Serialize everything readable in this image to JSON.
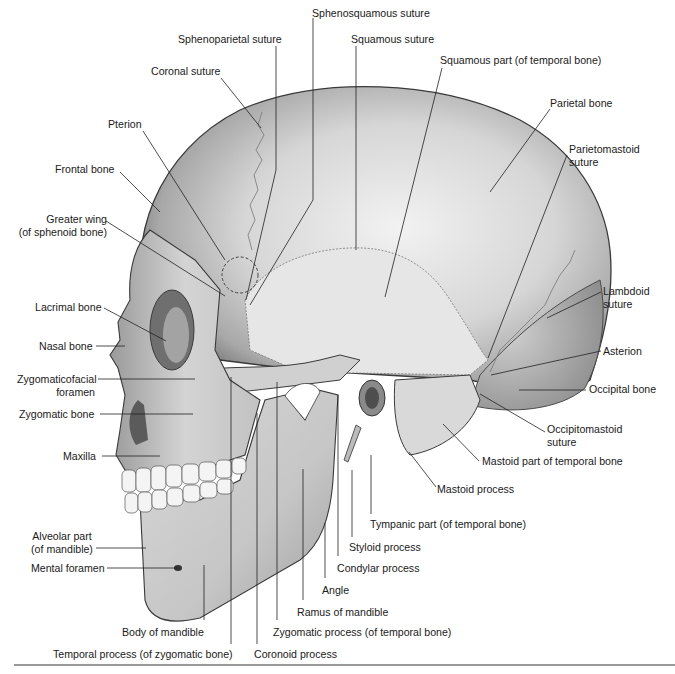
{
  "figure": {
    "colors": {
      "bone_light": "#e9e9e9",
      "bone_mid": "#bdbdbd",
      "bone_dark": "#6e6e6e",
      "outline": "#3a3a3a",
      "leader": "#222222",
      "rule": "#9a9a9a"
    }
  },
  "labels": [
    {
      "id": "sphenosquamous-suture",
      "lines": [
        "Sphenosquamous suture"
      ],
      "x": 312,
      "y": 7,
      "align": "l",
      "leader": [
        [
          313,
          18
        ],
        [
          313,
          200
        ],
        [
          250,
          305
        ]
      ]
    },
    {
      "id": "sphenoparietal-suture",
      "lines": [
        "Sphenoparietal suture"
      ],
      "x": 178,
      "y": 33,
      "align": "l",
      "leader": [
        [
          276,
          46
        ],
        [
          276,
          170
        ],
        [
          246,
          300
        ]
      ]
    },
    {
      "id": "squamous-suture",
      "lines": [
        "Squamous suture"
      ],
      "x": 351,
      "y": 33,
      "align": "l",
      "leader": [
        [
          356,
          46
        ],
        [
          356,
          250
        ]
      ]
    },
    {
      "id": "coronal-suture",
      "lines": [
        "Coronal suture"
      ],
      "x": 151,
      "y": 65,
      "align": "l",
      "leader": [
        [
          221,
          78
        ],
        [
          261,
          128
        ]
      ]
    },
    {
      "id": "squamous-part-temporal",
      "lines": [
        "Squamous part (of temporal bone)"
      ],
      "x": 440,
      "y": 54,
      "align": "l",
      "leader": [
        [
          442,
          68
        ],
        [
          385,
          297
        ]
      ]
    },
    {
      "id": "parietal-bone",
      "lines": [
        "Parietal bone"
      ],
      "x": 550,
      "y": 97,
      "align": "l",
      "leader": [
        [
          550,
          109
        ],
        [
          490,
          192
        ]
      ]
    },
    {
      "id": "pterion",
      "lines": [
        "Pterion"
      ],
      "x": 108,
      "y": 118,
      "align": "l",
      "leader": [
        [
          143,
          131
        ],
        [
          225,
          260
        ]
      ]
    },
    {
      "id": "parietomastoid-suture",
      "lines": [
        "Parietomastoid",
        "suture"
      ],
      "x": 569,
      "y": 143,
      "align": "l",
      "leader": [
        [
          567,
          155
        ],
        [
          488,
          358
        ]
      ]
    },
    {
      "id": "frontal-bone",
      "lines": [
        "Frontal bone"
      ],
      "x": 55,
      "y": 163,
      "align": "l",
      "leader": [
        [
          120,
          172
        ],
        [
          160,
          212
        ]
      ]
    },
    {
      "id": "greater-wing-sphenoid",
      "lines": [
        "Greater wing",
        "(of sphenoid bone)"
      ],
      "x": 14,
      "y": 213,
      "align": "r",
      "w": 93,
      "leader": [
        [
          106,
          221
        ],
        [
          225,
          296
        ]
      ]
    },
    {
      "id": "lambdoid-suture",
      "lines": [
        "Lambdoid",
        "suture"
      ],
      "x": 603,
      "y": 285,
      "align": "l",
      "leader": [
        [
          601,
          292
        ],
        [
          547,
          318
        ]
      ]
    },
    {
      "id": "lacrimal-bone",
      "lines": [
        "Lacrimal bone"
      ],
      "x": 35,
      "y": 301,
      "align": "l",
      "leader": [
        [
          104,
          308
        ],
        [
          166,
          341
        ]
      ]
    },
    {
      "id": "nasal-bone",
      "lines": [
        "Nasal bone"
      ],
      "x": 39,
      "y": 340,
      "align": "l",
      "leader": [
        [
          96,
          346
        ],
        [
          125,
          346
        ]
      ]
    },
    {
      "id": "asterion",
      "lines": [
        "Asterion"
      ],
      "x": 603,
      "y": 345,
      "align": "l",
      "leader": [
        [
          601,
          351
        ],
        [
          491,
          375
        ]
      ]
    },
    {
      "id": "zygomaticofacial-foramen",
      "lines": [
        "Zygomaticofacial",
        "foramen"
      ],
      "x": 17,
      "y": 373,
      "align": "r",
      "w": 78,
      "leader": [
        [
          98,
          379
        ],
        [
          195,
          379
        ]
      ]
    },
    {
      "id": "occipital-bone",
      "lines": [
        "Occipital bone"
      ],
      "x": 589,
      "y": 383,
      "align": "l",
      "leader": [
        [
          586,
          390
        ],
        [
          519,
          390
        ]
      ]
    },
    {
      "id": "zygomatic-bone",
      "lines": [
        "Zygomatic bone"
      ],
      "x": 19,
      "y": 408,
      "align": "l",
      "leader": [
        [
          100,
          414
        ],
        [
          193,
          414
        ]
      ]
    },
    {
      "id": "occipitomastoid-suture",
      "lines": [
        "Occipitomastoid",
        "suture"
      ],
      "x": 547,
      "y": 423,
      "align": "l",
      "leader": [
        [
          545,
          432
        ],
        [
          480,
          394
        ]
      ]
    },
    {
      "id": "maxilla",
      "lines": [
        "Maxilla"
      ],
      "x": 63,
      "y": 450,
      "align": "l",
      "leader": [
        [
          102,
          456
        ],
        [
          160,
          456
        ]
      ]
    },
    {
      "id": "mastoid-part-temporal",
      "lines": [
        "Mastoid part of temporal bone"
      ],
      "x": 482,
      "y": 455,
      "align": "l",
      "leader": [
        [
          479,
          461
        ],
        [
          443,
          424
        ]
      ]
    },
    {
      "id": "mastoid-process",
      "lines": [
        "Mastoid process"
      ],
      "x": 437,
      "y": 483,
      "align": "l",
      "leader": [
        [
          436,
          487
        ],
        [
          409,
          452
        ]
      ]
    },
    {
      "id": "tympanic-part-temporal",
      "lines": [
        "Tympanic part (of temporal bone)"
      ],
      "x": 370,
      "y": 518,
      "align": "l",
      "leader": [
        [
          371,
          514
        ],
        [
          371,
          455
        ]
      ]
    },
    {
      "id": "alveolar-part-mandible",
      "lines": [
        "Alveolar part",
        "(of mandible)"
      ],
      "x": 22,
      "y": 530,
      "align": "c",
      "w": 80,
      "leader": [
        [
          96,
          548
        ],
        [
          146,
          548
        ]
      ]
    },
    {
      "id": "styloid-process",
      "lines": [
        "Styloid process"
      ],
      "x": 349,
      "y": 541,
      "align": "l",
      "leader": [
        [
          352,
          537
        ],
        [
          352,
          470
        ]
      ]
    },
    {
      "id": "mental-foramen",
      "lines": [
        "Mental foramen"
      ],
      "x": 31,
      "y": 562,
      "align": "l",
      "leader": [
        [
          107,
          568
        ],
        [
          177,
          568
        ]
      ]
    },
    {
      "id": "condylar-process",
      "lines": [
        "Condylar process"
      ],
      "x": 337,
      "y": 562,
      "align": "l",
      "leader": [
        [
          338,
          556
        ],
        [
          338,
          395
        ]
      ]
    },
    {
      "id": "angle",
      "lines": [
        "Angle"
      ],
      "x": 322,
      "y": 584,
      "align": "l",
      "leader": [
        [
          325,
          578
        ],
        [
          325,
          523
        ]
      ]
    },
    {
      "id": "ramus-of-mandible",
      "lines": [
        "Ramus of mandible"
      ],
      "x": 297,
      "y": 606,
      "align": "l",
      "leader": [
        [
          303,
          600
        ],
        [
          303,
          469
        ]
      ]
    },
    {
      "id": "body-of-mandible",
      "lines": [
        "Body of mandible"
      ],
      "x": 122,
      "y": 626,
      "align": "l",
      "leader": [
        [
          204,
          620
        ],
        [
          204,
          565
        ]
      ]
    },
    {
      "id": "zygomatic-process-temporal",
      "lines": [
        "Zygomatic process (of temporal bone)"
      ],
      "x": 273,
      "y": 626,
      "align": "l",
      "leader": [
        [
          277,
          620
        ],
        [
          277,
          382
        ]
      ]
    },
    {
      "id": "temporal-process-zygomatic",
      "lines": [
        "Temporal process (of zygomatic bone)"
      ],
      "x": 53,
      "y": 648,
      "align": "l",
      "leader": [
        [
          231,
          644
        ],
        [
          231,
          377
        ]
      ]
    },
    {
      "id": "coronoid-process",
      "lines": [
        "Coronoid process"
      ],
      "x": 254,
      "y": 648,
      "align": "l",
      "leader": [
        [
          257,
          644
        ],
        [
          257,
          413
        ]
      ]
    }
  ]
}
